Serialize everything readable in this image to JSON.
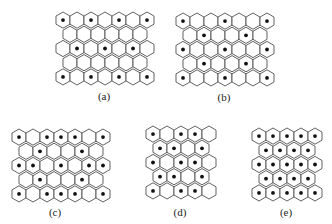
{
  "figure": {
    "panels": [
      {
        "id": "a",
        "label": "(a)",
        "origin": [
          55,
          11
        ],
        "caption_pos": [
          104,
          90
        ],
        "rows": [
          {
            "count": 7,
            "offset": false,
            "dots": [
              1,
              3,
              5,
              7
            ]
          },
          {
            "count": 6,
            "offset": true,
            "dots": []
          },
          {
            "count": 7,
            "offset": false,
            "dots": [
              2,
              4,
              6
            ]
          },
          {
            "count": 6,
            "offset": true,
            "dots": []
          },
          {
            "count": 7,
            "offset": false,
            "dots": [
              1,
              3,
              5,
              7
            ]
          }
        ]
      },
      {
        "id": "b",
        "label": "(b)",
        "origin": [
          175,
          12
        ],
        "caption_pos": [
          224,
          91
        ],
        "rows": [
          {
            "count": 7,
            "offset": false,
            "dots": [
              1,
              4,
              7
            ]
          },
          {
            "count": 6,
            "offset": true,
            "dots": [
              2,
              5
            ]
          },
          {
            "count": 7,
            "offset": false,
            "dots": [
              1,
              4,
              7
            ]
          },
          {
            "count": 6,
            "offset": true,
            "dots": [
              2,
              5
            ]
          },
          {
            "count": 7,
            "offset": false,
            "dots": [
              1,
              4,
              7
            ]
          }
        ]
      },
      {
        "id": "c",
        "label": "(c)",
        "origin": [
          11,
          128
        ],
        "caption_pos": [
          55,
          206
        ],
        "rows": [
          {
            "count": 7,
            "offset": false,
            "dots": [
              1,
              3,
              4,
              5,
              7
            ]
          },
          {
            "count": 6,
            "offset": true,
            "dots": [
              2,
              5
            ]
          },
          {
            "count": 7,
            "offset": false,
            "dots": [
              1,
              2,
              4,
              6,
              7
            ]
          },
          {
            "count": 6,
            "offset": true,
            "dots": [
              2,
              5
            ]
          },
          {
            "count": 7,
            "offset": false,
            "dots": [
              1,
              3,
              4,
              5,
              7
            ]
          }
        ]
      },
      {
        "id": "d",
        "label": "(d)",
        "origin": [
          145,
          125
        ],
        "caption_pos": [
          180,
          206
        ],
        "rows": [
          {
            "count": 5,
            "offset": false,
            "dots": [
              1,
              3,
              4
            ]
          },
          {
            "count": 4,
            "offset": true,
            "dots": [
              1,
              2,
              4
            ]
          },
          {
            "count": 5,
            "offset": false,
            "dots": [
              1,
              3,
              4
            ]
          },
          {
            "count": 4,
            "offset": true,
            "dots": [
              1,
              2,
              4
            ]
          },
          {
            "count": 5,
            "offset": false,
            "dots": [
              1,
              3,
              4
            ]
          }
        ]
      },
      {
        "id": "e",
        "label": "(e)",
        "origin": [
          251,
          127
        ],
        "caption_pos": [
          286,
          206
        ],
        "rows": [
          {
            "count": 5,
            "offset": false,
            "dots": [
              1,
              2,
              3,
              4,
              5
            ]
          },
          {
            "count": 4,
            "offset": true,
            "dots": [
              1,
              2,
              3,
              4
            ]
          },
          {
            "count": 5,
            "offset": false,
            "dots": [
              1,
              2,
              3,
              4,
              5
            ]
          },
          {
            "count": 4,
            "offset": true,
            "dots": [
              1,
              2,
              3,
              4
            ]
          },
          {
            "count": 5,
            "offset": false,
            "dots": [
              1,
              2,
              3,
              4,
              5
            ]
          }
        ]
      }
    ],
    "hex": {
      "width": 14,
      "radius": 8.1,
      "row_pitch": 14.2,
      "dot_radius": 1.9
    },
    "colors": {
      "stroke": "#3a3a3a",
      "fill": "#ffffff",
      "dot": "#111111"
    }
  },
  "captions": {
    "a": "(a)",
    "b": "(b)",
    "c": "(c)",
    "d": "(d)",
    "e": "(e)"
  }
}
